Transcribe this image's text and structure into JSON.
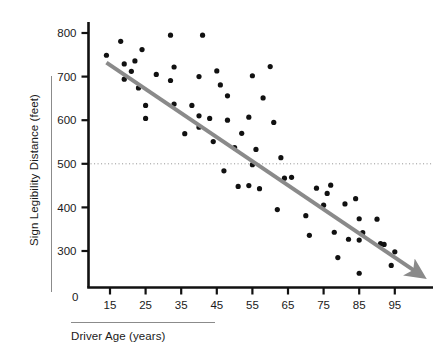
{
  "chart_data": {
    "type": "scatter",
    "title": "",
    "xlabel": "Driver Age (years)",
    "ylabel": "Sign Legibility Distance (feet)",
    "xlim": [
      8,
      102
    ],
    "ylim": [
      225,
      825
    ],
    "xticks": [
      15,
      25,
      35,
      45,
      55,
      65,
      75,
      85,
      95
    ],
    "xtick_labels": [
      "15",
      "25",
      "35",
      "45",
      "55",
      "65",
      "75",
      "85",
      "95"
    ],
    "yticks": [
      300,
      400,
      500,
      600,
      700,
      800
    ],
    "ytick_labels": [
      "300",
      "400",
      "500",
      "600",
      "700",
      "800"
    ],
    "origin_label": "0",
    "grid": false,
    "legend": null,
    "point_color": "#111111",
    "point_radius": 2.6,
    "axis_color": "#111111",
    "reference_line": {
      "orientation": "horizontal",
      "y": 500,
      "style": "dotted",
      "color": "#999999"
    },
    "trend_line": {
      "type": "linear-fit-arrow",
      "color": "#8a8a8a",
      "width": 4,
      "arrowhead": true,
      "x_start": 14,
      "y_start": 732,
      "x_end": 101,
      "y_end": 252
    },
    "points": [
      {
        "x": 14,
        "y": 749
      },
      {
        "x": 18,
        "y": 781
      },
      {
        "x": 19,
        "y": 729
      },
      {
        "x": 19,
        "y": 694
      },
      {
        "x": 21,
        "y": 712
      },
      {
        "x": 22,
        "y": 736
      },
      {
        "x": 23,
        "y": 674
      },
      {
        "x": 24,
        "y": 762
      },
      {
        "x": 25,
        "y": 634
      },
      {
        "x": 25,
        "y": 604
      },
      {
        "x": 28,
        "y": 705
      },
      {
        "x": 32,
        "y": 795
      },
      {
        "x": 32,
        "y": 691
      },
      {
        "x": 33,
        "y": 722
      },
      {
        "x": 33,
        "y": 637
      },
      {
        "x": 36,
        "y": 569
      },
      {
        "x": 38,
        "y": 634
      },
      {
        "x": 40,
        "y": 700
      },
      {
        "x": 40,
        "y": 610
      },
      {
        "x": 40,
        "y": 584
      },
      {
        "x": 41,
        "y": 795
      },
      {
        "x": 43,
        "y": 604
      },
      {
        "x": 44,
        "y": 551
      },
      {
        "x": 45,
        "y": 713
      },
      {
        "x": 46,
        "y": 681
      },
      {
        "x": 47,
        "y": 484
      },
      {
        "x": 48,
        "y": 656
      },
      {
        "x": 48,
        "y": 600
      },
      {
        "x": 50,
        "y": 537
      },
      {
        "x": 51,
        "y": 448
      },
      {
        "x": 52,
        "y": 570
      },
      {
        "x": 54,
        "y": 450
      },
      {
        "x": 54,
        "y": 607
      },
      {
        "x": 55,
        "y": 702
      },
      {
        "x": 55,
        "y": 498
      },
      {
        "x": 56,
        "y": 533
      },
      {
        "x": 57,
        "y": 443
      },
      {
        "x": 58,
        "y": 651
      },
      {
        "x": 60,
        "y": 723
      },
      {
        "x": 61,
        "y": 595
      },
      {
        "x": 62,
        "y": 395
      },
      {
        "x": 63,
        "y": 514
      },
      {
        "x": 64,
        "y": 467
      },
      {
        "x": 66,
        "y": 469
      },
      {
        "x": 70,
        "y": 381
      },
      {
        "x": 71,
        "y": 336
      },
      {
        "x": 73,
        "y": 444
      },
      {
        "x": 75,
        "y": 405
      },
      {
        "x": 76,
        "y": 432
      },
      {
        "x": 77,
        "y": 451
      },
      {
        "x": 78,
        "y": 343
      },
      {
        "x": 79,
        "y": 285
      },
      {
        "x": 81,
        "y": 408
      },
      {
        "x": 82,
        "y": 327
      },
      {
        "x": 84,
        "y": 420
      },
      {
        "x": 85,
        "y": 374
      },
      {
        "x": 85,
        "y": 325
      },
      {
        "x": 85,
        "y": 249
      },
      {
        "x": 86,
        "y": 342
      },
      {
        "x": 90,
        "y": 373
      },
      {
        "x": 91,
        "y": 317
      },
      {
        "x": 92,
        "y": 315
      },
      {
        "x": 94,
        "y": 267
      },
      {
        "x": 95,
        "y": 298
      }
    ]
  }
}
